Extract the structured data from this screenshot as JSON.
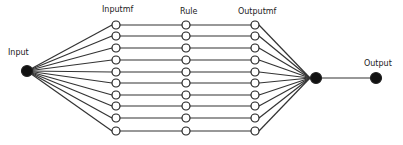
{
  "diagram": {
    "type": "neuro-fuzzy network (ANFIS-like)",
    "labels": {
      "input": "Input",
      "inputmf": "Inputmf",
      "rule": "Rule",
      "outputmf": "Outputmf",
      "output": "Output"
    },
    "layers": [
      {
        "name": "Input",
        "nodes": 1,
        "style": "filled"
      },
      {
        "name": "Inputmf",
        "nodes": 10,
        "style": "hollow"
      },
      {
        "name": "Rule",
        "nodes": 10,
        "style": "hollow"
      },
      {
        "name": "Outputmf",
        "nodes": 10,
        "style": "hollow"
      },
      {
        "name": "Aggregation",
        "nodes": 1,
        "style": "filled"
      },
      {
        "name": "Output",
        "nodes": 1,
        "style": "filled"
      }
    ],
    "colors": {
      "line": "#333333",
      "node_fill": "#111111",
      "hollow_fill": "#ffffff"
    }
  }
}
